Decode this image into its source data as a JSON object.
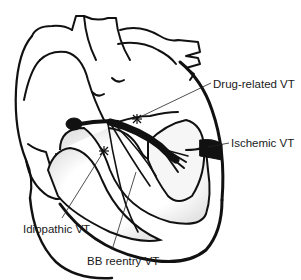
{
  "diagram": {
    "colors": {
      "outline": "#111111",
      "background": "#ffffff",
      "shading": "#e6e6e6"
    },
    "labels": [
      {
        "id": "drug-related",
        "text": "Drug-related VT",
        "x": 213,
        "y": 79
      },
      {
        "id": "ischemic",
        "text": "Ischemic VT",
        "x": 231,
        "y": 138
      },
      {
        "id": "idiopathic",
        "text": "Idiopathic VT",
        "x": 23,
        "y": 224
      },
      {
        "id": "bb-reentry",
        "text": "BB reentry VT",
        "x": 87,
        "y": 256
      }
    ],
    "markers": [
      {
        "id": "drug-related-site",
        "symbol": "asterisk",
        "x": 137,
        "y": 119
      },
      {
        "id": "idiopathic-site",
        "symbol": "asterisk",
        "x": 104,
        "y": 151
      },
      {
        "id": "ischemic-site",
        "symbol": "asterisk",
        "x": 206,
        "y": 148
      }
    ]
  }
}
